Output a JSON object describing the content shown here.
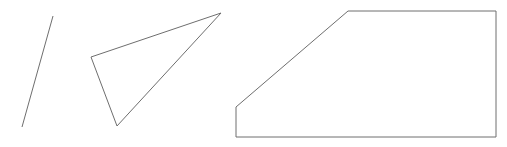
{
  "canvas": {
    "width": 507,
    "height": 147,
    "background_color": "#ffffff",
    "stroke_color": "#6e6e6e",
    "stroke_width": 1,
    "fill": "none",
    "description": "Three black-and-white line-art geometric figures drawn side by side on a plain white background"
  },
  "figures": [
    {
      "id": "line-segment",
      "name": "line-segment",
      "type": "open-polyline",
      "label": "single diagonal line segment",
      "closed": false,
      "vertex_count": 2,
      "points": "22,127 53,16",
      "vertices": [
        {
          "x": 22,
          "y": 127
        },
        {
          "x": 53,
          "y": 16
        }
      ]
    },
    {
      "id": "triangle",
      "name": "triangle",
      "type": "open-polyline",
      "label": "thin scalene triangle outline",
      "closed": false,
      "vertex_count": 3,
      "points": "91,57 221,13 117,126 91,57",
      "vertices": [
        {
          "x": 91,
          "y": 57
        },
        {
          "x": 221,
          "y": 13
        },
        {
          "x": 117,
          "y": 126
        }
      ]
    },
    {
      "id": "pentagon",
      "name": "pentagon",
      "type": "closed-polygon",
      "label": "right trapezoid with chamfered upper-left corner",
      "closed": true,
      "vertex_count": 5,
      "points": "236,107 348,11 496,11 496,137 236,137",
      "vertices": [
        {
          "x": 236,
          "y": 107
        },
        {
          "x": 348,
          "y": 11
        },
        {
          "x": 496,
          "y": 11
        },
        {
          "x": 496,
          "y": 137
        },
        {
          "x": 236,
          "y": 137
        }
      ]
    }
  ]
}
